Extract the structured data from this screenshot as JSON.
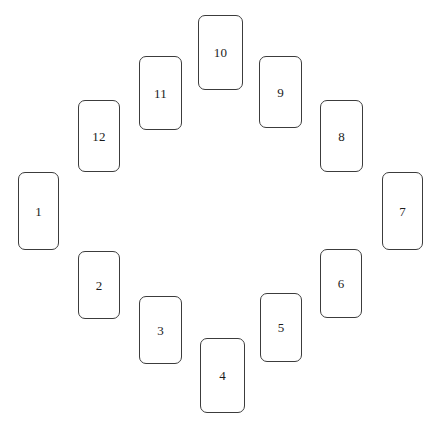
{
  "canvas": {
    "width": 438,
    "height": 428,
    "background_color": "#ffffff"
  },
  "style": {
    "card_border_color": "#3c3c3c",
    "card_fill_color": "#ffffff",
    "card_border_width": 1,
    "card_corner_radius": 7,
    "label_color": "#1b1b1b",
    "label_font_size": 13
  },
  "layout": {
    "arrangement": "circular-clock",
    "count": 12,
    "center_x": 220,
    "center_y": 214
  },
  "cards": [
    {
      "label": "1",
      "x": 18,
      "y": 172,
      "w": 41,
      "h": 78,
      "position": "west"
    },
    {
      "label": "2",
      "x": 78,
      "y": 251,
      "w": 42,
      "h": 68,
      "position": "west-south-west"
    },
    {
      "label": "3",
      "x": 139,
      "y": 296,
      "w": 43,
      "h": 68,
      "position": "south-south-west"
    },
    {
      "label": "4",
      "x": 200,
      "y": 338,
      "w": 45,
      "h": 75,
      "position": "south"
    },
    {
      "label": "5",
      "x": 260,
      "y": 293,
      "w": 42,
      "h": 69,
      "position": "south-south-east"
    },
    {
      "label": "6",
      "x": 320,
      "y": 249,
      "w": 42,
      "h": 69,
      "position": "east-south-east"
    },
    {
      "label": "7",
      "x": 382,
      "y": 172,
      "w": 41,
      "h": 78,
      "position": "east"
    },
    {
      "label": "8",
      "x": 320,
      "y": 100,
      "w": 43,
      "h": 72,
      "position": "east-north-east"
    },
    {
      "label": "9",
      "x": 259,
      "y": 56,
      "w": 43,
      "h": 72,
      "position": "north-north-east"
    },
    {
      "label": "10",
      "x": 198,
      "y": 15,
      "w": 45,
      "h": 75,
      "position": "north"
    },
    {
      "label": "11",
      "x": 139,
      "y": 56,
      "w": 43,
      "h": 74,
      "position": "north-north-west"
    },
    {
      "label": "12",
      "x": 78,
      "y": 100,
      "w": 42,
      "h": 72,
      "position": "west-north-west"
    }
  ]
}
